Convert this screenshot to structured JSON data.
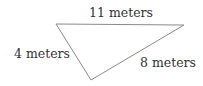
{
  "diagram": {
    "type": "triangle",
    "vertices": {
      "top_left": [
        56,
        24
      ],
      "top_right": [
        184,
        25
      ],
      "bottom": [
        91,
        80
      ]
    },
    "sides": [
      {
        "id": "top",
        "label": "11 meters"
      },
      {
        "id": "left",
        "label": "4 meters"
      },
      {
        "id": "right",
        "label": "8 meters"
      }
    ],
    "stroke_color": "#888888",
    "text_color": "#333333"
  }
}
